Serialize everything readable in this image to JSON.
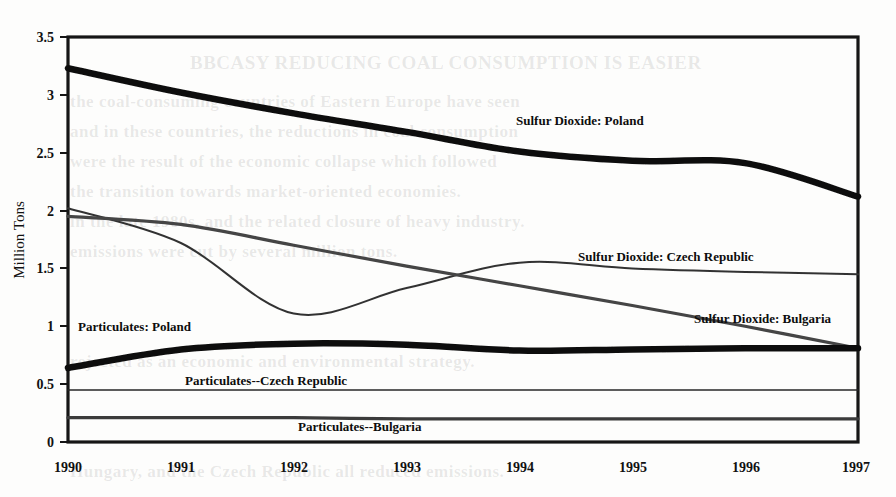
{
  "chart_data": {
    "type": "line",
    "title": "",
    "subtitle": "",
    "xlabel": "",
    "ylabel": "Million Tons",
    "xlim": [
      1990,
      1997
    ],
    "ylim": [
      0,
      3.5
    ],
    "grid": false,
    "legend_position": "inline-annotations",
    "x_ticks": [
      "1990",
      "1991",
      "1992",
      "1993",
      "1994",
      "1995",
      "1996",
      "1997"
    ],
    "y_ticks": [
      "0",
      "0.5",
      "1",
      "1.5",
      "2",
      "2.5",
      "3",
      "3.5"
    ],
    "x": [
      1990,
      1991,
      1992,
      1993,
      1994,
      1995,
      1996,
      1997
    ],
    "series": [
      {
        "name": "Sulfur Dioxide: Poland",
        "label": "Sulfur Dioxide: Poland",
        "style": "thick",
        "color": "#111111",
        "values": [
          3.23,
          3.02,
          2.84,
          2.68,
          2.51,
          2.43,
          2.41,
          2.12
        ]
      },
      {
        "name": "Sulfur Dioxide: Czech Republic",
        "label": "Sulfur Dioxide: Czech Republic",
        "style": "thin",
        "color": "#333333",
        "values": [
          2.02,
          1.72,
          1.11,
          1.33,
          1.55,
          1.5,
          1.47,
          1.45
        ]
      },
      {
        "name": "Sulfur Dioxide: Bulgaria",
        "label": "Sulfur Dioxide: Bulgaria",
        "style": "medium",
        "color": "#444444",
        "values": [
          1.95,
          1.88,
          1.7,
          1.52,
          1.35,
          1.18,
          1.0,
          0.81
        ]
      },
      {
        "name": "Particulates: Poland",
        "label": "Particulates: Poland",
        "style": "thick",
        "color": "#111111",
        "values": [
          0.64,
          0.8,
          0.85,
          0.84,
          0.79,
          0.8,
          0.81,
          0.81
        ]
      },
      {
        "name": "Particulates--Czech Republic",
        "label": "Particulates--Czech Republic",
        "style": "hairline",
        "color": "#2a2a2a",
        "values": [
          0.45,
          0.45,
          0.45,
          0.45,
          0.45,
          0.45,
          0.45,
          0.45
        ]
      },
      {
        "name": "Particulates--Bulgaria",
        "label": "Particulates--Bulgaria",
        "style": "medium",
        "color": "#3a3a3a",
        "values": [
          0.21,
          0.21,
          0.21,
          0.2,
          0.2,
          0.2,
          0.2,
          0.2
        ]
      }
    ]
  },
  "axes": {
    "y_label": "Million Tons",
    "y_ticks": [
      {
        "value": "3.5"
      },
      {
        "value": "3"
      },
      {
        "value": "2.5"
      },
      {
        "value": "2"
      },
      {
        "value": "1.5"
      },
      {
        "value": "1"
      },
      {
        "value": "0.5"
      },
      {
        "value": "0"
      }
    ],
    "x_ticks": [
      {
        "value": "1990"
      },
      {
        "value": "1991"
      },
      {
        "value": "1992"
      },
      {
        "value": "1993"
      },
      {
        "value": "1994"
      },
      {
        "value": "1995"
      },
      {
        "value": "1996"
      },
      {
        "value": "1997"
      }
    ]
  },
  "annotations": [
    {
      "text": "Sulfur Dioxide: Poland"
    },
    {
      "text": "Sulfur Dioxide: Czech Republic"
    },
    {
      "text": "Sulfur Dioxide: Bulgaria"
    },
    {
      "text": "Particulates: Poland"
    },
    {
      "text": "Particulates--Czech Republic"
    },
    {
      "text": "Particulates--Bulgaria"
    }
  ],
  "background_bleed": [
    {
      "text": "BBCASY REDUCING COAL CONSUMPTION IS EASIER"
    },
    {
      "text": "the coal-consuming countries of Eastern Europe have seen"
    },
    {
      "text": "and in these countries, the reductions in coal consumption"
    },
    {
      "text": "were the result of the economic collapse which followed"
    },
    {
      "text": "the transition towards market-oriented economies."
    },
    {
      "text": "in the late 1980s, and the related closure of heavy industry."
    },
    {
      "text": "emissions were cut by several million tons."
    },
    {
      "text": "rejected as an economic and environmental strategy."
    },
    {
      "text": "Hungary, and the Czech Republic all reduced emissions."
    }
  ]
}
